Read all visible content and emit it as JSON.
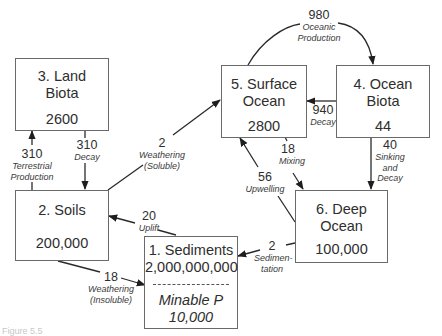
{
  "diagram": {
    "type": "phosphorus-cycle-reservoir-flux-diagram",
    "reservoirs": [
      {
        "id": "sediments",
        "name": "1. Sediments",
        "value": "2,000,000,000",
        "sub_name": "Minable P",
        "sub_value": "10,000"
      },
      {
        "id": "soils",
        "name": "2.  Soils",
        "value": "200,000"
      },
      {
        "id": "land_biota",
        "name_line1": "3. Land",
        "name_line2": "Biota",
        "value": "2600"
      },
      {
        "id": "ocean_biota",
        "name_line1": "4. Ocean",
        "name_line2": "Biota",
        "value": "44"
      },
      {
        "id": "surface_ocean",
        "name_line1": "5. Surface",
        "name_line2": "Ocean",
        "value": "2800"
      },
      {
        "id": "deep_ocean",
        "name_line1": "6. Deep",
        "name_line2": "Ocean",
        "value": "100,000"
      }
    ],
    "fluxes": [
      {
        "id": "terrestrial_production",
        "from": "soils",
        "to": "land_biota",
        "value": "310",
        "label_line1": "Terrestrial",
        "label_line2": "Production"
      },
      {
        "id": "land_decay",
        "from": "land_biota",
        "to": "soils",
        "value": "310",
        "label_line1": "Decay"
      },
      {
        "id": "weathering_soluble",
        "from": "soils",
        "to": "surface_ocean",
        "value": "2",
        "label_line1": "Weathering",
        "label_line2": "(Soluble)"
      },
      {
        "id": "oceanic_production",
        "from": "surface_ocean",
        "to": "ocean_biota",
        "value": "980",
        "label_line1": "Oceanic",
        "label_line2": "Production"
      },
      {
        "id": "ocean_decay",
        "from": "ocean_biota",
        "to": "surface_ocean",
        "value": "940",
        "label_line1": "Decay"
      },
      {
        "id": "sinking_decay",
        "from": "ocean_biota",
        "to": "deep_ocean",
        "value": "40",
        "label_line1": "Sinking",
        "label_line2": "and",
        "label_line3": "Decay"
      },
      {
        "id": "mixing",
        "from": "surface_ocean",
        "to": "deep_ocean",
        "value": "18",
        "label_line1": "Mixing"
      },
      {
        "id": "upwelling",
        "from": "deep_ocean",
        "to": "surface_ocean",
        "value": "56",
        "label_line1": "Upwelling"
      },
      {
        "id": "sedimentation",
        "from": "deep_ocean",
        "to": "sediments",
        "value": "2",
        "label_line1": "Sedimen-",
        "label_line2": "tation"
      },
      {
        "id": "uplift",
        "from": "sediments",
        "to": "soils",
        "value": "20",
        "label_line1": "Uplift"
      },
      {
        "id": "weathering_insoluble",
        "from": "soils",
        "to": "sediments",
        "value": "18",
        "label_line1": "Weathering",
        "label_line2": "(Insoluble)"
      }
    ],
    "colors": {
      "line": "#2a2a2a",
      "box_border": "#6a6a6a",
      "text": "#2e2e2e"
    }
  },
  "caption": "Figure 5.5"
}
